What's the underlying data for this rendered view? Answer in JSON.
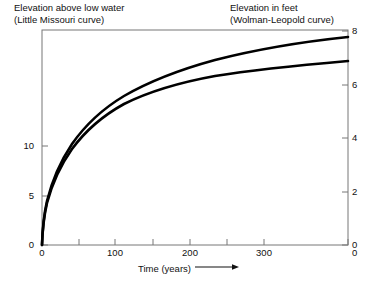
{
  "header": {
    "left_line1": "Elevation above low water",
    "left_line2": "(Little Missouri curve)",
    "right_line1": "Elevation in feet",
    "right_line2": "(Wolman-Leopold curve)"
  },
  "xtitle": "Time (years)",
  "chart_data": {
    "type": "line",
    "title": "",
    "xlabel": "Time (years)",
    "ylabel": "Elevation above low water",
    "ylabel_right": "Elevation in feet",
    "xlim": [
      0,
      320
    ],
    "ylim_left": [
      0,
      11
    ],
    "ylim_right": [
      0,
      8
    ],
    "xticks": [
      0,
      100,
      200,
      300
    ],
    "xticks_minor": [
      50,
      150,
      250
    ],
    "yticks_left": [
      0,
      5,
      10
    ],
    "yticks_right": [
      0,
      2,
      4,
      6,
      8
    ],
    "grid": false,
    "legend": "none",
    "x": [
      0,
      2,
      5,
      10,
      20,
      30,
      50,
      75,
      100,
      125,
      150,
      175,
      200,
      225,
      250,
      275,
      300,
      320
    ],
    "series": [
      {
        "name": "Little Missouri curve",
        "axis": "left",
        "values": [
          0.0,
          2.6,
          4.3,
          5.6,
          6.9,
          7.7,
          8.6,
          9.3,
          9.8,
          10.2,
          10.5,
          10.8,
          11.0,
          11.2,
          11.4,
          11.6,
          11.7,
          11.8
        ]
      },
      {
        "name": "Wolman-Leopold curve",
        "axis": "right",
        "values": [
          0.0,
          1.9,
          3.2,
          4.1,
          5.0,
          5.6,
          6.3,
          6.8,
          7.1,
          7.4,
          7.6,
          7.8,
          8.0,
          8.1,
          8.2,
          8.3,
          8.4,
          8.5
        ]
      }
    ],
    "curves_px": {
      "upper": "M42,245 C42.5,229 44,214 47,201 C52,181 60,162 72,144 C86,124 104,108 124,96 C150,81 182,69 215,60 C258,49 300,42 348,37",
      "lower": "M42,245 C42.5,230 44,216 47,203 C52,184 60,166 72,149 C86,130 104,115 124,104 C150,91 182,82 215,76 C258,69 302,65 348,61"
    }
  },
  "ticks": {
    "left": [
      {
        "label": "10",
        "y": 146
      },
      {
        "label": "5",
        "y": 196
      },
      {
        "label": "0",
        "y": 245
      }
    ],
    "right": [
      {
        "label": "8",
        "y": 31
      },
      {
        "label": "6",
        "y": 85
      },
      {
        "label": "4",
        "y": 138
      },
      {
        "label": "2",
        "y": 192
      },
      {
        "label": "0",
        "y": 245
      }
    ],
    "bottom": [
      {
        "label": "0",
        "x": 42
      },
      {
        "label": "100",
        "x": 115
      },
      {
        "label": "200",
        "x": 190
      },
      {
        "label": "300",
        "x": 264
      }
    ]
  }
}
